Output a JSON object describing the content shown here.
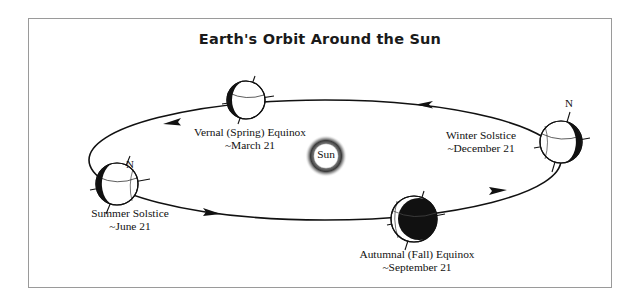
{
  "figure": {
    "title": "Earth's Orbit Around the Sun",
    "border_color": "#9a9a9a",
    "background": "#ffffff",
    "ink_color": "#111111"
  },
  "sun": {
    "label": "Sun",
    "glow_color": "#2b2b2b",
    "core_color": "#ffffff"
  },
  "orbit": {
    "direction": "counterclockwise",
    "arrow_count": 4,
    "line_color": "#111111"
  },
  "positions": [
    {
      "id": "vernal",
      "name": "Vernal (Spring) Equinox",
      "date": "~March 21",
      "pole_label": "",
      "night_side": "left"
    },
    {
      "id": "winter",
      "name": "Winter Solstice",
      "date": "~December 21",
      "pole_label": "N",
      "night_side": "right"
    },
    {
      "id": "summer",
      "name": "Summer Solstice",
      "date": "~June 21",
      "pole_label": "N",
      "night_side": "left"
    },
    {
      "id": "autumnal",
      "name": "Autumnal (Fall) Equinox",
      "date": "~September 21",
      "pole_label": "",
      "night_side": "right"
    }
  ]
}
